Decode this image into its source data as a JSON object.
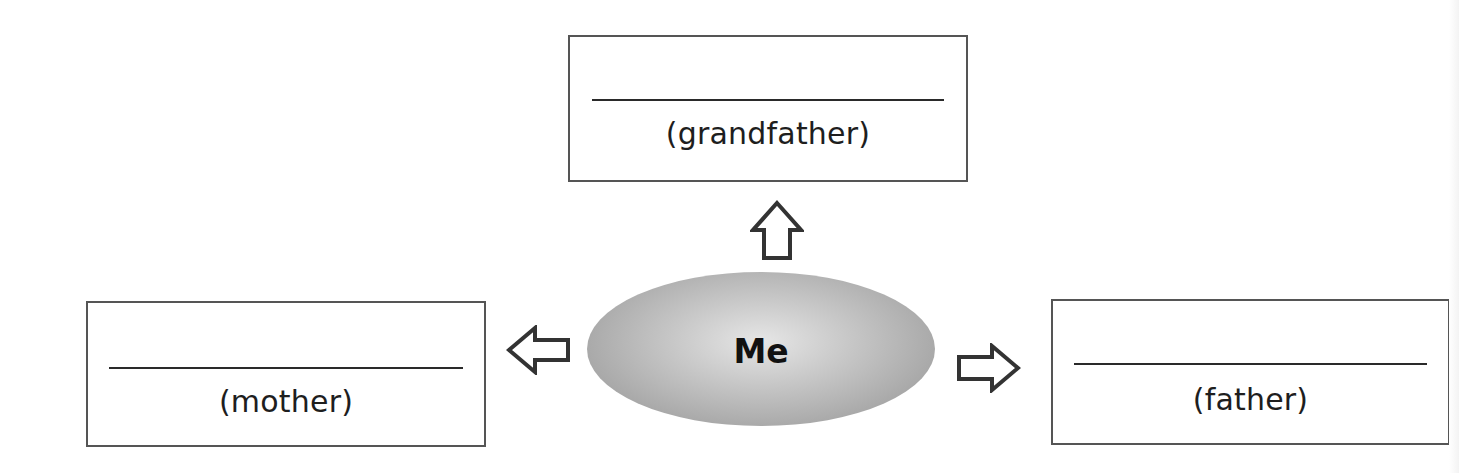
{
  "diagram": {
    "type": "family-relationship-map",
    "center": {
      "label": "Me",
      "fill_color": "#b8b8b8"
    },
    "boxes": {
      "top": {
        "blank": "",
        "label": "(grandfather)"
      },
      "left": {
        "blank": "",
        "label": "(mother)"
      },
      "right": {
        "blank": "",
        "label": "(father)"
      }
    },
    "arrows": [
      {
        "direction": "up",
        "target": "grandfather"
      },
      {
        "direction": "left",
        "target": "mother"
      },
      {
        "direction": "right",
        "target": "father"
      }
    ],
    "colors": {
      "border": "#555555",
      "line": "#2a2a2a",
      "text": "#1e1e1e",
      "background": "#ffffff"
    }
  }
}
